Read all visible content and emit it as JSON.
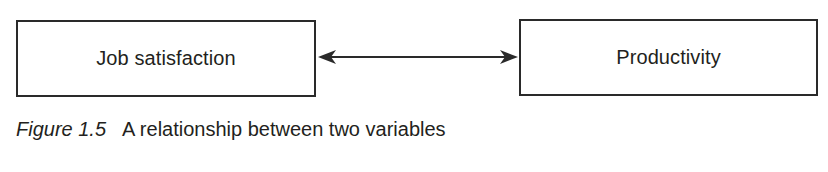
{
  "diagram": {
    "nodes": [
      {
        "id": "job-satisfaction",
        "label": "Job satisfaction"
      },
      {
        "id": "productivity",
        "label": "Productivity"
      }
    ],
    "edges": [
      {
        "from": "job-satisfaction",
        "to": "productivity",
        "type": "bidirectional-arrow"
      }
    ],
    "caption": {
      "figure_label": "Figure 1.5",
      "text": "A relationship between two variables"
    }
  },
  "colors": {
    "stroke": "#2a2a2a",
    "text": "#231f20",
    "background": "#ffffff"
  }
}
